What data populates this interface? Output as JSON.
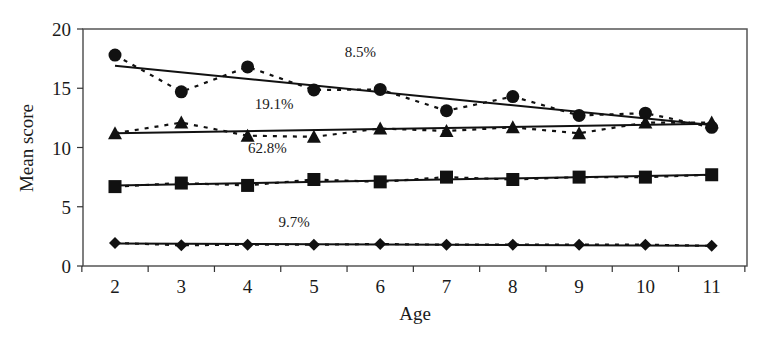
{
  "chart_data": {
    "type": "line",
    "title": "",
    "xlabel": "Age",
    "ylabel": "Mean score",
    "x": [
      2,
      3,
      4,
      5,
      6,
      7,
      8,
      9,
      10,
      11
    ],
    "xlim": [
      1.5,
      11.5
    ],
    "ylim": [
      0,
      20
    ],
    "yticks": [
      0,
      5,
      10,
      15,
      20
    ],
    "xticks": [
      2,
      3,
      4,
      5,
      6,
      7,
      8,
      9,
      10,
      11
    ],
    "grid": false,
    "legend": "none",
    "series": [
      {
        "name": "circle series",
        "marker": "circle",
        "values": [
          17.8,
          14.7,
          16.8,
          14.85,
          14.9,
          13.1,
          14.3,
          12.7,
          12.9,
          11.7
        ],
        "trend": [
          16.9,
          11.9
        ],
        "annotation": "8.5%"
      },
      {
        "name": "triangle series",
        "marker": "triangle",
        "values": [
          11.2,
          12.1,
          11.0,
          10.9,
          11.6,
          11.4,
          11.7,
          11.2,
          12.1,
          12.1
        ],
        "trend": [
          11.2,
          12.0
        ],
        "annotation": "19.1%"
      },
      {
        "name": "square series",
        "marker": "square",
        "values": [
          6.7,
          7.0,
          6.8,
          7.3,
          7.1,
          7.5,
          7.3,
          7.5,
          7.5,
          7.7
        ],
        "trend": [
          6.8,
          7.7
        ],
        "annotation": "62.8%"
      },
      {
        "name": "diamond series",
        "marker": "diamond",
        "values": [
          1.95,
          1.75,
          1.8,
          1.8,
          1.85,
          1.8,
          1.8,
          1.8,
          1.8,
          1.7
        ],
        "trend": [
          1.9,
          1.7
        ],
        "annotation": "9.7%"
      }
    ],
    "annotations": [
      {
        "text": "8.5%",
        "x": 5.7,
        "y": 18.1
      },
      {
        "text": "19.1%",
        "x": 4.4,
        "y": 13.7
      },
      {
        "text": "62.8%",
        "x": 4.3,
        "y": 10.0
      },
      {
        "text": "9.7%",
        "x": 4.7,
        "y": 3.7
      }
    ]
  },
  "axes": {
    "xlabel": "Age",
    "ylabel": "Mean score"
  }
}
